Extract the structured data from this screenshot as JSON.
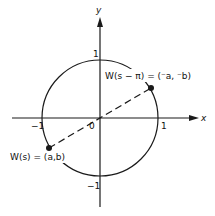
{
  "diagram": {
    "type": "unit-circle",
    "axes": {
      "x_label": "x",
      "y_label": "y"
    },
    "ticks": {
      "x_pos": "1",
      "x_neg": "−1",
      "y_pos": "1",
      "y_neg": "−1",
      "origin": "0"
    },
    "points": [
      {
        "name": "W(s)",
        "label": "W(s) = (a,b)",
        "angle_deg": 210
      },
      {
        "name": "W(s − π)",
        "label": "W(s − π) = (⁻aa, ⁻b)",
        "angle_deg": 30
      }
    ],
    "labels": {
      "point_lower_left": "W(s) = (a,b)",
      "point_upper_right": "W(s − π) = (⁻a, ⁻b)"
    },
    "colors": {
      "stroke": "#1a1a1a",
      "background": "#ffffff"
    }
  }
}
